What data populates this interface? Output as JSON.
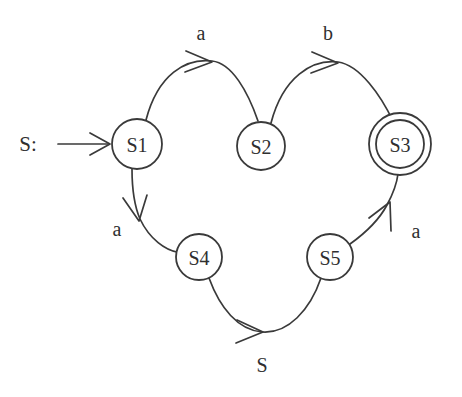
{
  "diagram": {
    "kind": "finite-state-machine",
    "background_color": "#ffffff",
    "stroke_color": "#3a3a3a",
    "text_color": "#2f2f2f",
    "start_marker": {
      "label": "S:",
      "points_to": "S1"
    },
    "states": [
      {
        "id": "S1",
        "label": "S1",
        "accepting": false,
        "cx": 137,
        "cy": 144,
        "r": 25
      },
      {
        "id": "S2",
        "label": "S2",
        "accepting": false,
        "cx": 261,
        "cy": 146,
        "r": 24
      },
      {
        "id": "S3",
        "label": "S3",
        "accepting": true,
        "cx": 400,
        "cy": 144,
        "r": 24,
        "r_outer": 31
      },
      {
        "id": "S4",
        "label": "S4",
        "accepting": false,
        "cx": 199,
        "cy": 257,
        "r": 23
      },
      {
        "id": "S5",
        "label": "S5",
        "accepting": false,
        "cx": 330,
        "cy": 257,
        "r": 23
      }
    ],
    "transitions": [
      {
        "from": "S1",
        "to": "S2",
        "label": "a",
        "label_x": 201,
        "label_y": 33
      },
      {
        "from": "S2",
        "to": "S3",
        "label": "b",
        "label_x": 328,
        "label_y": 33
      },
      {
        "from": "S1",
        "to": "S4",
        "label": "a",
        "label_x": 117,
        "label_y": 229
      },
      {
        "from": "S4",
        "to": "S5",
        "label": "S",
        "label_x": 262,
        "label_y": 365
      },
      {
        "from": "S5",
        "to": "S3",
        "label": "a",
        "label_x": 416,
        "label_y": 231
      }
    ]
  }
}
